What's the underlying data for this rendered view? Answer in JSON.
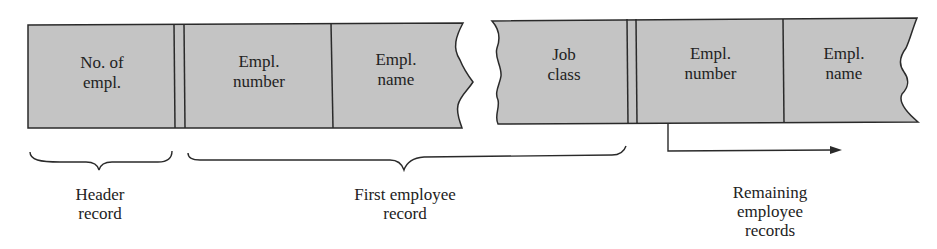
{
  "diagram": {
    "colors": {
      "field_fill": "#c4c4c4",
      "stroke": "#2a2a2a",
      "background": "#ffffff"
    },
    "left_segment": {
      "fields": [
        {
          "label_line1": "No. of",
          "label_line2": "empl."
        },
        {
          "label_line1": "Empl.",
          "label_line2": "number"
        },
        {
          "label_line1": "Empl.",
          "label_line2": "name"
        }
      ]
    },
    "right_segment": {
      "fields": [
        {
          "label_line1": "Job",
          "label_line2": "class"
        },
        {
          "label_line1": "Empl.",
          "label_line2": "number"
        },
        {
          "label_line1": "Empl.",
          "label_line2": "name"
        }
      ]
    },
    "captions": {
      "header": {
        "line1": "Header",
        "line2": "record"
      },
      "first": {
        "line1": "First employee",
        "line2": "record"
      },
      "remaining": {
        "line1": "Remaining",
        "line2": "employee",
        "line3": "records"
      }
    }
  }
}
